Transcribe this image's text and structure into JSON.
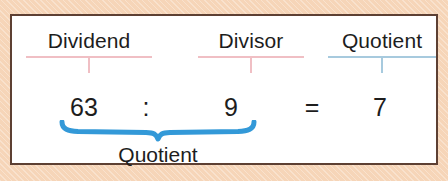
{
  "figure": {
    "kind": "division-terminology-diagram",
    "background_color": "#f6d5b8",
    "card_background": "#ffffff",
    "card_border_color": "#5d4033",
    "accent_pink": "#f0bfc4",
    "accent_blue": "#a7cade",
    "brace_blue": "#3399d8",
    "text_color": "#1d1d1d"
  },
  "labels": {
    "dividend": "Dividend",
    "divisor": "Divisor",
    "quotient": "Quotient"
  },
  "equation": {
    "dividend": "63",
    "operator": ":",
    "divisor": "9",
    "equals": "=",
    "quotient": "7"
  },
  "brace": {
    "label": "Quotient",
    "color": "#3399d8",
    "spans": "63 : 9"
  }
}
